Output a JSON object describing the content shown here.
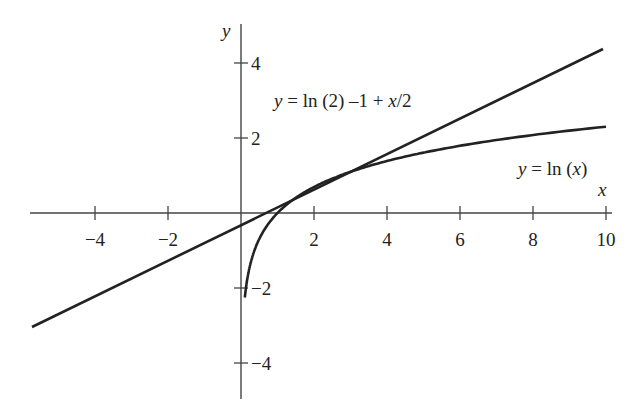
{
  "chart_data": {
    "type": "line",
    "title": "",
    "xlabel": "x",
    "ylabel": "y",
    "xlim": [
      -5.6,
      10
    ],
    "ylim": [
      -4.6,
      4.7
    ],
    "grid": false,
    "x_ticks": [
      -4,
      -2,
      2,
      4,
      6,
      8,
      10
    ],
    "x_tick_labels": [
      "−4",
      "−2",
      "2",
      "4",
      "6",
      "8",
      "10"
    ],
    "y_ticks": [
      4,
      2,
      -2,
      -4
    ],
    "y_tick_labels": [
      "4",
      "2",
      "−2",
      "−4"
    ],
    "series": [
      {
        "name": "y = ln (2) –1 + x/2",
        "kind": "tangent line",
        "x": [
          -5.6,
          0,
          2,
          10
        ],
        "y": [
          -3.11,
          -0.31,
          0.69,
          4.69
        ]
      },
      {
        "name": "y = ln (x)",
        "kind": "curve",
        "x": [
          0.1,
          0.25,
          0.5,
          1,
          2,
          4,
          6,
          8,
          10
        ],
        "y": [
          -2.3,
          -1.39,
          -0.69,
          0,
          0.69,
          1.39,
          1.79,
          2.08,
          2.3
        ]
      }
    ],
    "annotations": [
      {
        "text_prefix": "y",
        "text_rest": " = ln (2) –1 + ",
        "text_var": "x",
        "text_tail": "/2",
        "near": "tangent line"
      },
      {
        "text_prefix": "y",
        "text_rest": " = ln (",
        "text_var": "x",
        "text_tail": ")",
        "near": "log curve"
      }
    ]
  },
  "axis_labels": {
    "x": "x",
    "y": "y"
  }
}
